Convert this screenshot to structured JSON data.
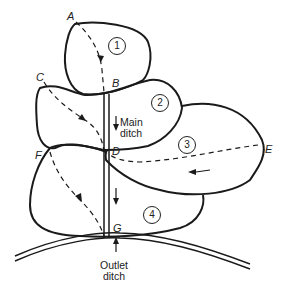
{
  "diagram": {
    "points": {
      "A": "A",
      "B": "B",
      "C": "C",
      "D": "D",
      "E": "E",
      "F": "F",
      "G": "G"
    },
    "fields": [
      "1",
      "2",
      "3",
      "4"
    ],
    "main_ditch_label_line1": "Main",
    "main_ditch_label_line2": "ditch",
    "outlet_ditch_label_line1": "Outlet",
    "outlet_ditch_label_line2": "ditch",
    "colors": {
      "line": "#1a1a1a",
      "background": "#ffffff"
    }
  }
}
